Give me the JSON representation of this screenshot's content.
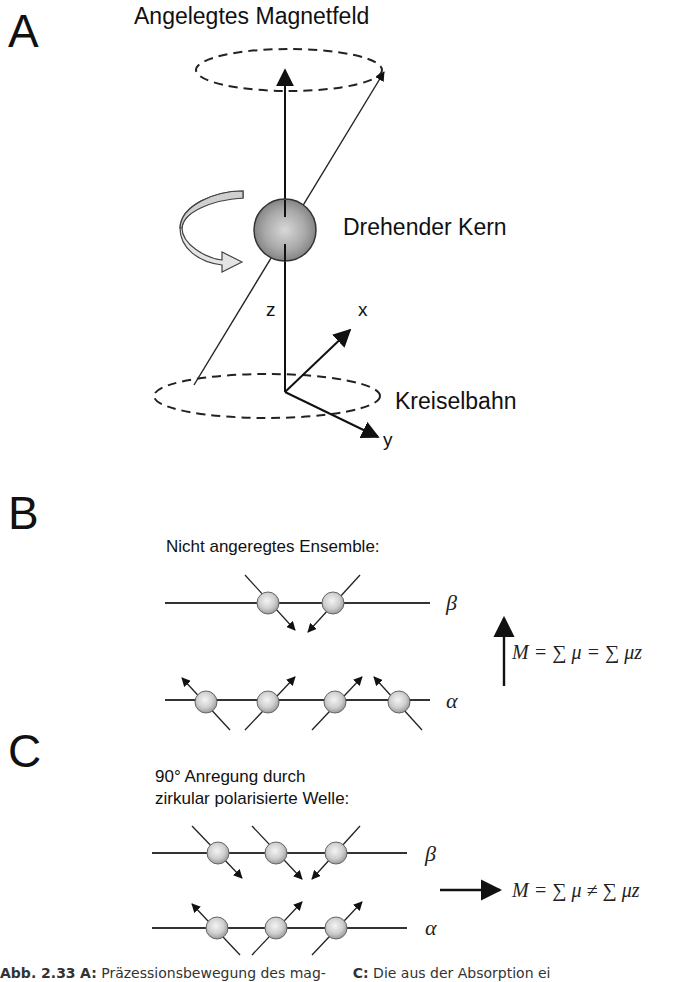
{
  "panels": {
    "A": {
      "letter": "A",
      "title": "Angelegtes Magnetfeld",
      "nucleus_label": "Drehender Kern",
      "orbit_label": "Kreiselbahn",
      "axes": {
        "z": "z",
        "x": "x",
        "y": "y"
      }
    },
    "B": {
      "letter": "B",
      "heading": "Nicht angeregtes Ensemble:",
      "beta_label": "β",
      "alpha_label": "α",
      "equation": "M = ∑ μ = ∑ μz",
      "beta_spins": 2,
      "alpha_spins": 4
    },
    "C": {
      "letter": "C",
      "heading_line1": "90° Anregung durch",
      "heading_line2": "zirkular polarisierte Welle:",
      "beta_label": "β",
      "alpha_label": "α",
      "equation": "M = ∑ μ ≠ ∑ μz",
      "beta_spins": 3,
      "alpha_spins": 3
    }
  },
  "caption": {
    "figure_ref": "Abb. 2.33",
    "part_a_key": "A:",
    "part_a_text": "Präzessionsbewegung des mag-",
    "part_c_key": "C:",
    "part_c_text": "Die aus der Absorption ei"
  }
}
